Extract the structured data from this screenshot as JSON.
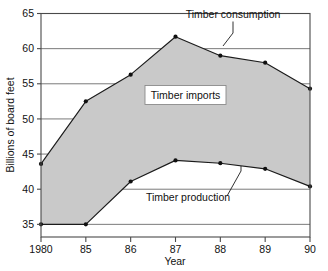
{
  "chart_data": {
    "type": "area",
    "title": "",
    "subtitle": "",
    "xlabel": "Year",
    "ylabel": "Billions of board feet",
    "categories": [
      "1980",
      "85",
      "86",
      "87",
      "88",
      "89",
      "90"
    ],
    "x_tick_labels": [
      "1980",
      "85",
      "86",
      "87",
      "88",
      "89",
      "90"
    ],
    "y_tick_labels": [
      "35",
      "40",
      "45",
      "50",
      "55",
      "60",
      "65"
    ],
    "y_ticks": [
      35,
      40,
      45,
      50,
      55,
      60,
      65
    ],
    "ylim": [
      33.2,
      65
    ],
    "grid": "horizontal",
    "legend_position": "inline-annotations",
    "series": [
      {
        "name": "Timber consumption",
        "values": [
          43.6,
          52.5,
          56.3,
          61.7,
          59.0,
          58.0,
          54.3
        ],
        "marker": "filled-circle",
        "color": "#1b1b1b"
      },
      {
        "name": "Timber production",
        "values": [
          35.0,
          35.0,
          41.1,
          44.1,
          43.7,
          42.9,
          40.4
        ],
        "marker": "filled-circle",
        "color": "#1b1b1b"
      }
    ],
    "band": {
      "name": "Timber imports",
      "upper_series": "Timber consumption",
      "lower_series": "Timber production",
      "fill_color": "#c9c9c9"
    },
    "annotations": [
      {
        "id": "consumption",
        "text": "Timber consumption",
        "points_to_series": "Timber consumption",
        "points_to_index": 4
      },
      {
        "id": "imports",
        "text": "Timber imports",
        "boxed": true
      },
      {
        "id": "production",
        "text": "Timber production",
        "points_to_series": "Timber production",
        "points_to_index": 5
      }
    ]
  },
  "axes": {
    "y_axis_title": "Billions of board feet",
    "x_axis_title": "Year"
  },
  "annotations_text": {
    "consumption": "Timber consumption",
    "imports": "Timber imports",
    "production": "Timber production"
  },
  "colors": {
    "band_fill": "#c9c9c9",
    "line": "#1b1b1b",
    "grid": "#6b6b6b",
    "frame": "#4a4a4a",
    "background": "#ffffff"
  }
}
